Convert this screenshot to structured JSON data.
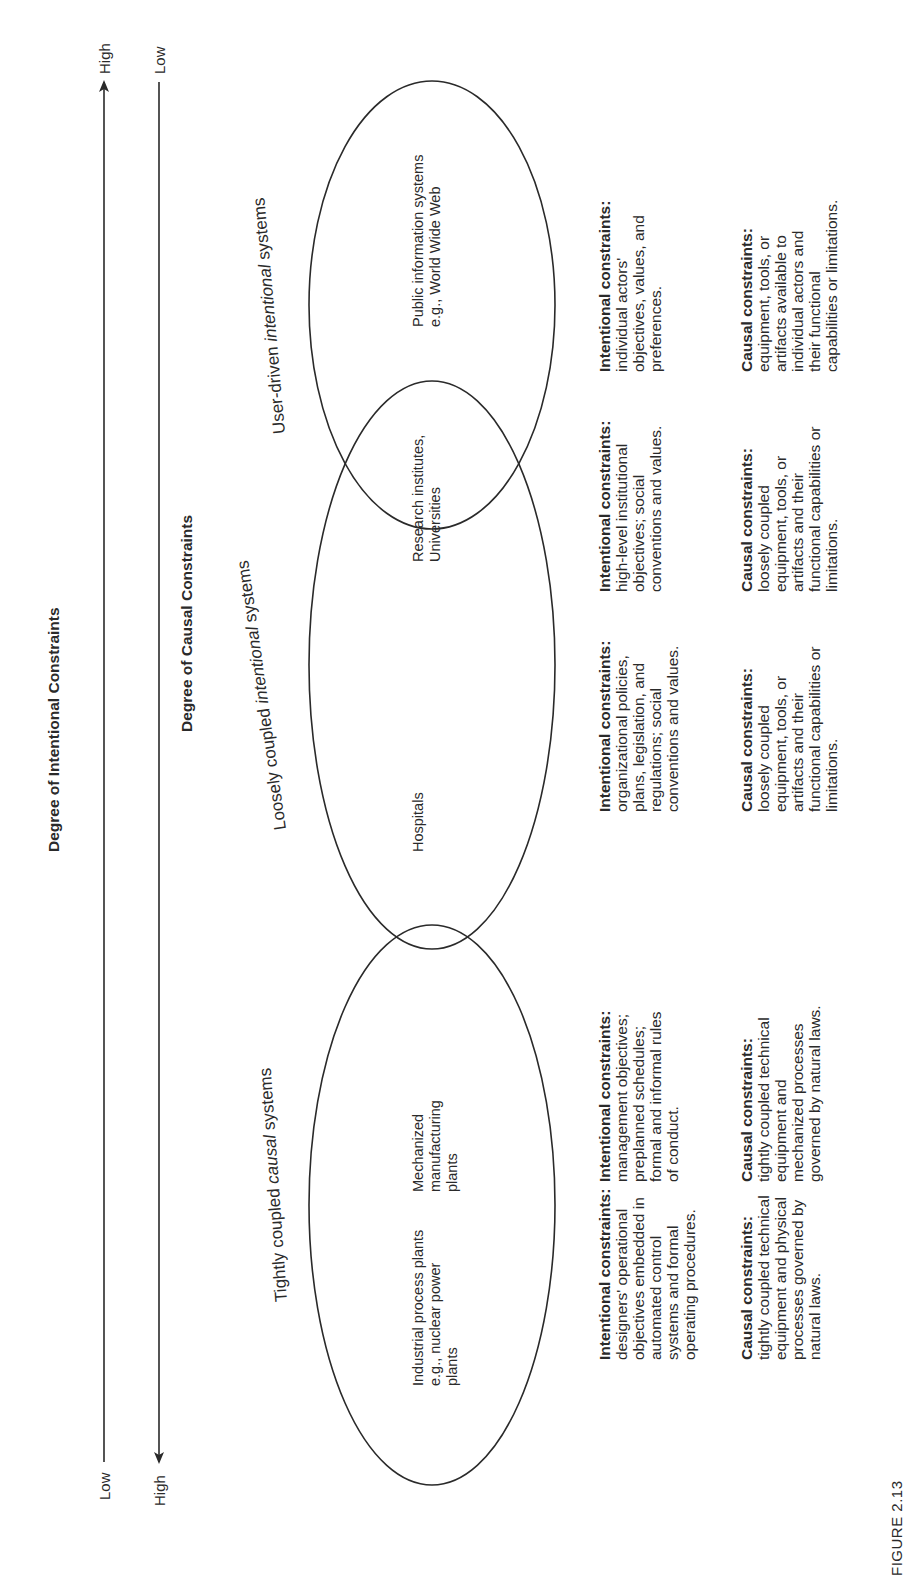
{
  "figure": {
    "label": "FIGURE 2.13"
  },
  "axes": {
    "intentional": {
      "title": "Degree of Intentional Constraints",
      "start_label": "Low",
      "end_label": "High",
      "arrow_direction": "toward High"
    },
    "causal": {
      "title": "Degree of Causal Constraints",
      "start_label": "High",
      "end_label": "Low",
      "arrow_direction": "toward High"
    }
  },
  "systems": [
    {
      "category_prefix": "Tightly coupled ",
      "category_emph": "causal",
      "category_suffix": " systems",
      "examples": [
        "Industrial process plants\ne.g., nuclear power\nplants",
        "Mechanized\nmanufacturing\nplants"
      ],
      "intentional_heading": "Intentional constraints:",
      "intentional_texts": [
        "designers' operational\nobjectives embedded in\nautomated control\nsystems and formal\noperating procedures.",
        "management objectives;\npreplanned schedules;\nformal and informal rules\nof conduct."
      ],
      "causal_heading": "Causal constraints:",
      "causal_texts": [
        "tightly coupled technical\nequipment and physical\nprocesses governed by\nnatural laws.",
        "tightly coupled technical\nequipment and\nmechanized processes\ngoverned by natural laws."
      ]
    },
    {
      "category_prefix": "Loosely coupled ",
      "category_emph": "intentional",
      "category_suffix": " systems",
      "examples": [
        "Hospitals",
        "Research institutes,\nUniversities"
      ],
      "intentional_heading": "Intentional constraints:",
      "intentional_texts": [
        "organizational policies,\nplans, legislation, and\nregulations; social\nconventions and values.",
        "high-level institutional\nobjectives; social\nconventions and values."
      ],
      "causal_heading": "Causal constraints:",
      "causal_texts": [
        "loosely coupled\nequipment, tools, or\nartifacts and their\nfunctional capabilities or\nlimitations.",
        "loosely coupled\nequipment, tools, or\nartifacts and their\nfunctional capabilities or\nlimitations."
      ]
    },
    {
      "category_prefix": "User-driven ",
      "category_emph": "intentional",
      "category_suffix": " systems",
      "examples": [
        "Public information systems\ne.g., World Wide Web"
      ],
      "intentional_heading": "Intentional constraints:",
      "intentional_texts": [
        "individual actors'\nobjectives, values, and\npreferences."
      ],
      "causal_heading": "Causal constraints:",
      "causal_texts": [
        "equipment, tools, or\nartifacts available to\nindividual actors and\ntheir functional\ncapabilities or limitations."
      ]
    }
  ],
  "colors": {
    "ink": "#2a2a2a",
    "background": "#ffffff"
  }
}
